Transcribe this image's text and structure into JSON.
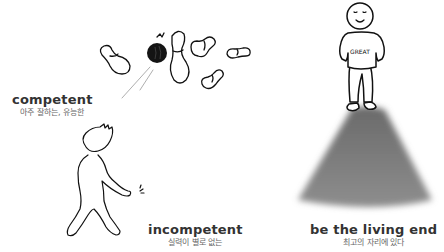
{
  "terms": [
    {
      "word": "competent",
      "gloss": "아주 잘하는, 유능한"
    },
    {
      "word": "incompetent",
      "gloss": "실력이 별로 없는"
    },
    {
      "word": "be the living end",
      "gloss": "최고의 자리에 있다"
    }
  ],
  "illustrations": {
    "bowling": "bowling-ball-knocking-pins",
    "walker": "figure-walking-away",
    "hero": "smiling-figure-in-spotlight",
    "shirt_text": "GREAT"
  },
  "colors": {
    "background": "#ffffff",
    "heading": "#333333",
    "gloss": "#666666",
    "spotlight": "#8a8a8a"
  }
}
